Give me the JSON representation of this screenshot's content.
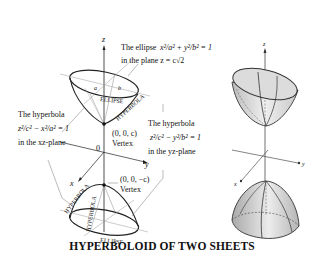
{
  "caption": "HYPERBOLOID OF TWO SHEETS",
  "labels": {
    "z_axis": "z",
    "x_axis": "x",
    "y_axis": "y",
    "origin": "0",
    "a": "a",
    "b": "b",
    "ellipse_top": "ELLIPSE",
    "ellipse_bottom": "ELLIPSE",
    "hyperbola_top": "HYPERBOLA",
    "hyperbola_bottom_left": "HYPERBOLA",
    "hyperbola_bottom_mid": "HYPERBOLA"
  },
  "annotations": {
    "ellipse": {
      "line1": "The ellipse",
      "eq": "x²/a² + y²/b² = 1",
      "line2": "in the plane z = c√2"
    },
    "hyperbola_xz": {
      "line1": "The hyperbola",
      "eq": "z²/c² − x²/a² = 1",
      "line2": "in the xz-plane"
    },
    "hyperbola_yz": {
      "line1": "The hyperbola",
      "eq": "z²/c² − y²/b² = 1",
      "line2": "in the yz-plane"
    },
    "vertex_top": {
      "coord": "(0, 0, c)",
      "label": "Vertex"
    },
    "vertex_bottom": {
      "coord": "(0, 0, −c)",
      "label": "Vertex"
    }
  },
  "right_figure": {
    "z_axis": "z",
    "x_axis": "x",
    "y_axis": "y"
  }
}
